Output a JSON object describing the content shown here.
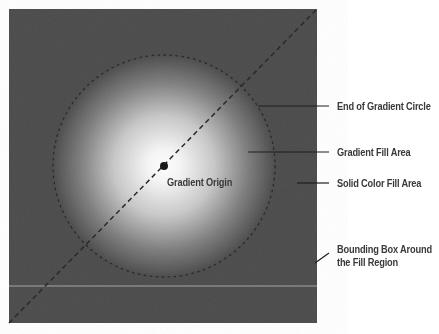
{
  "figure": {
    "type": "radial-gradient-diagram",
    "colors": {
      "background": "#ffffff",
      "solid_fill": "#4a4a4a",
      "gradient_center": "#ffffff",
      "guide_line": "#1e1e1e",
      "label_text": "#3a3a3a"
    },
    "bounding_box": {
      "x": 9,
      "y": 9,
      "width": 308,
      "height": 314
    },
    "gradient_circle": {
      "cx": 164,
      "cy": 166,
      "r": 111
    },
    "origin": {
      "x": 164,
      "y": 166
    },
    "labels": {
      "gradient_origin": "Gradient Origin",
      "end_of_circle": "End of Gradient Circle",
      "gradient_fill_area": "Gradient Fill Area",
      "solid_color_fill_area": "Solid Color Fill Area",
      "bounding_box_line1": "Bounding Box Around",
      "bounding_box_line2": "the Fill Region"
    }
  }
}
